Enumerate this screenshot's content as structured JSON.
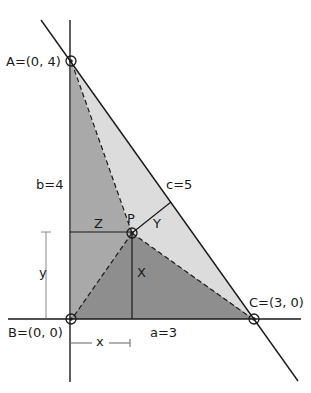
{
  "figure": {
    "type": "geometry-diagram"
  },
  "points": {
    "A": {
      "label": "A=(0, 4)",
      "px": [
        71,
        61
      ]
    },
    "B": {
      "label": "B=(0, 0)",
      "px": [
        71,
        319
      ]
    },
    "C": {
      "label": "C=(3, 0)",
      "px": [
        254,
        319
      ]
    },
    "P": {
      "label": "P",
      "px": [
        132,
        233
      ]
    }
  },
  "sides": {
    "a": "a=3",
    "b": "b=4",
    "c": "c=5"
  },
  "distances": {
    "X": "X",
    "Y": "Y",
    "Z": "Z"
  },
  "coordinates": {
    "x": "x",
    "y": "y"
  },
  "colors": {
    "background": "#ffffff",
    "line": "#1a1a1a",
    "region_PAB": "#a8a8a8",
    "region_PBC": "#8f8f8f",
    "region_PAC": "#dcdcdc",
    "dimension_line": "#888888"
  }
}
